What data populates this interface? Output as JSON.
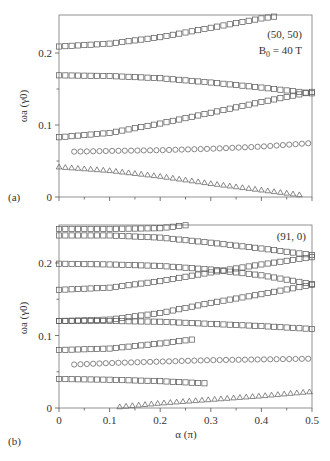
{
  "chart_data": [
    {
      "type": "scatter",
      "panel_label": "(a)",
      "annotation": [
        "(50, 50)",
        "B0 = 40 T"
      ],
      "xlabel": "",
      "ylabel": "ωa (γ0)",
      "xlim": [
        0,
        0.5
      ],
      "ylim": [
        0,
        0.253
      ],
      "yticks": [
        0,
        0.1,
        0.2
      ],
      "ytick_labels": [
        "0",
        "0.1",
        "0.2"
      ],
      "xticks": [
        0,
        0.05,
        0.1,
        0.15,
        0.2,
        0.25,
        0.3,
        0.35,
        0.4,
        0.45,
        0.5
      ],
      "xtick_labels_shown": false,
      "grid": false,
      "series": [
        {
          "name": "mode-1",
          "marker": "square",
          "x": [
            0,
            0.1,
            0.2,
            0.3,
            0.4,
            0.43
          ],
          "y": [
            0.209,
            0.213,
            0.222,
            0.235,
            0.248,
            0.251
          ]
        },
        {
          "name": "mode-2",
          "marker": "square",
          "x": [
            0,
            0.1,
            0.2,
            0.3,
            0.4,
            0.5
          ],
          "y": [
            0.169,
            0.168,
            0.165,
            0.159,
            0.152,
            0.144
          ]
        },
        {
          "name": "mode-3",
          "marker": "square",
          "x": [
            0,
            0.1,
            0.2,
            0.3,
            0.4,
            0.5
          ],
          "y": [
            0.083,
            0.089,
            0.102,
            0.117,
            0.132,
            0.146
          ]
        },
        {
          "name": "mode-4",
          "marker": "circle",
          "x": [
            0.03,
            0.1,
            0.2,
            0.3,
            0.4,
            0.5
          ],
          "y": [
            0.063,
            0.064,
            0.065,
            0.067,
            0.07,
            0.075
          ]
        },
        {
          "name": "mode-5",
          "marker": "triangle",
          "x": [
            0,
            0.1,
            0.2,
            0.3,
            0.4,
            0.48
          ],
          "y": [
            0.042,
            0.037,
            0.029,
            0.019,
            0.01,
            0.003
          ]
        }
      ]
    },
    {
      "type": "scatter",
      "panel_label": "(b)",
      "annotation": [
        "(91, 0)"
      ],
      "xlabel": "α (π)",
      "ylabel": "ωa (γ0)",
      "xlim": [
        0,
        0.5
      ],
      "ylim": [
        0,
        0.253
      ],
      "yticks": [
        0,
        0.1,
        0.2
      ],
      "ytick_labels": [
        "0",
        "0.1",
        "0.2"
      ],
      "xticks": [
        0,
        0.1,
        0.2,
        0.3,
        0.4,
        0.5
      ],
      "xtick_labels": [
        "0",
        "0.1",
        "0.2",
        "0.3",
        "0.4",
        "0.5"
      ],
      "grid": false,
      "series": [
        {
          "name": "mode-1",
          "marker": "square",
          "x": [
            0,
            0.1,
            0.2,
            0.25
          ],
          "y": [
            0.247,
            0.247,
            0.248,
            0.252
          ]
        },
        {
          "name": "mode-2",
          "marker": "square",
          "x": [
            0,
            0.1,
            0.2,
            0.3,
            0.4,
            0.5
          ],
          "y": [
            0.238,
            0.238,
            0.235,
            0.228,
            0.22,
            0.211
          ]
        },
        {
          "name": "mode-3",
          "marker": "square",
          "x": [
            0,
            0.1,
            0.2,
            0.3,
            0.4,
            0.5
          ],
          "y": [
            0.199,
            0.198,
            0.196,
            0.191,
            0.183,
            0.171
          ]
        },
        {
          "name": "mode-4",
          "marker": "square",
          "x": [
            0,
            0.1,
            0.2,
            0.3,
            0.4,
            0.5
          ],
          "y": [
            0.163,
            0.166,
            0.175,
            0.187,
            0.198,
            0.208
          ]
        },
        {
          "name": "mode-5",
          "marker": "square",
          "x": [
            0,
            0.1,
            0.2,
            0.3,
            0.4,
            0.5
          ],
          "y": [
            0.12,
            0.122,
            0.131,
            0.145,
            0.157,
            0.17
          ]
        },
        {
          "name": "mode-6",
          "marker": "square",
          "x": [
            0,
            0.1,
            0.2,
            0.3,
            0.4,
            0.5
          ],
          "y": [
            0.12,
            0.12,
            0.119,
            0.116,
            0.113,
            0.109
          ]
        },
        {
          "name": "mode-7",
          "marker": "square",
          "x": [
            0,
            0.1,
            0.2,
            0.27
          ],
          "y": [
            0.08,
            0.082,
            0.089,
            0.095
          ]
        },
        {
          "name": "mode-8",
          "marker": "circle",
          "x": [
            0.03,
            0.1,
            0.2,
            0.3,
            0.4,
            0.5
          ],
          "y": [
            0.06,
            0.062,
            0.064,
            0.066,
            0.067,
            0.068
          ]
        },
        {
          "name": "mode-9",
          "marker": "square",
          "x": [
            0,
            0.1,
            0.2,
            0.29
          ],
          "y": [
            0.04,
            0.039,
            0.037,
            0.034
          ]
        },
        {
          "name": "mode-10",
          "marker": "triangle",
          "x": [
            0.12,
            0.2,
            0.3,
            0.4,
            0.5
          ],
          "y": [
            0.002,
            0.007,
            0.012,
            0.017,
            0.023
          ]
        }
      ]
    }
  ]
}
